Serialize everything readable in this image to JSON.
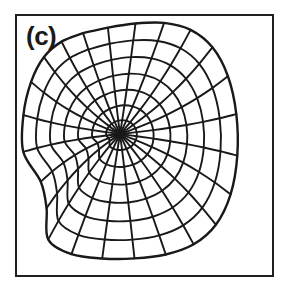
{
  "figure": {
    "panel_label": "(c)",
    "caption_text": "",
    "background_color": "#ffffff",
    "frame": {
      "border_color": "#231f20",
      "border_width_px": 2,
      "x": 15,
      "y": 14,
      "width": 259,
      "height": 263
    }
  },
  "chart_data": {
    "type": "surface-wireframe",
    "title": "(c)",
    "subtitle": "",
    "xlabel": "",
    "ylabel": "",
    "zlabel": "",
    "grid": false,
    "legend": "none",
    "axes_visible": false,
    "tick_labels": [],
    "annotations": [
      {
        "text": "(c)",
        "x": 26,
        "y": 23,
        "role": "panel-label"
      }
    ],
    "surface": {
      "function": "monkey-saddle",
      "u_range": [
        0,
        6.283185307
      ],
      "v_range": [
        0,
        1
      ],
      "u_divisions": 24,
      "v_divisions": 7,
      "singular_point": {
        "x": 120,
        "y": 134
      }
    },
    "line_style": {
      "stroke": "#191919",
      "stroke_width_outline": 2.4,
      "stroke_width_inner": 1.9
    },
    "lobes": [
      {
        "name": "upper-left-lobe",
        "apex": {
          "x": 114,
          "y": 62
        },
        "outer_edge": {
          "x": 58,
          "y": 112
        },
        "lower_edge": {
          "x": 58,
          "y": 172
        }
      },
      {
        "name": "upper-right-lobe",
        "apex": {
          "x": 212,
          "y": 60
        },
        "outer_edge": {
          "x": 214,
          "y": 160
        }
      },
      {
        "name": "lower-centre-lobe",
        "bottom": {
          "x": 170,
          "y": 256
        },
        "left_edge": {
          "x": 122,
          "y": 200
        },
        "right_edge": {
          "x": 216,
          "y": 190
        }
      }
    ],
    "bounds": {
      "x_min": 57,
      "x_max": 217,
      "y_min": 59,
      "y_max": 257
    }
  }
}
